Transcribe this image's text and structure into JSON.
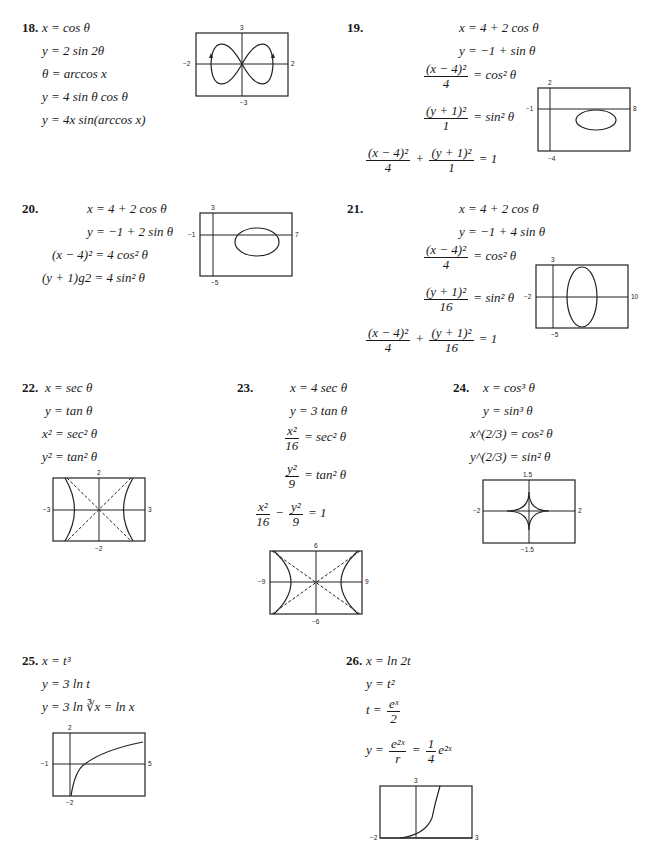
{
  "problems": [
    {
      "number": "18.",
      "lines": [
        "x = cos θ",
        "y = 2 sin 2θ",
        "θ = arccos x",
        "y = 4 sin θ cos θ",
        "y = 4x sin(arccos x)"
      ],
      "graph": {
        "ymax": "3",
        "ymin": "−3",
        "xmin": "−2",
        "xmax": "2"
      }
    },
    {
      "number": "19.",
      "lines": [
        "x = 4 + 2 cos θ",
        "y = −1 + sin θ"
      ],
      "frac1": {
        "num": "(x − 4)²",
        "den": "4",
        "rhs": "= cos² θ"
      },
      "frac2": {
        "num": "(y + 1)²",
        "den": "1",
        "rhs": "= sin² θ"
      },
      "final": {
        "a_num": "(x − 4)²",
        "a_den": "4",
        "op": "+",
        "b_num": "(y + 1)²",
        "b_den": "1",
        "rhs": "= 1"
      },
      "graph": {
        "ymax": "2",
        "ymin": "−4",
        "xmin": "−1",
        "xmax": "8"
      }
    },
    {
      "number": "20.",
      "lines": [
        "x = 4 + 2 cos θ",
        "y = −1 + 2 sin θ",
        "(x − 4)² = 4 cos² θ",
        "(y + 1)g2 = 4 sin² θ"
      ],
      "graph": {
        "ymax": "3",
        "ymin": "−5",
        "xmin": "−1",
        "xmax": "7"
      }
    },
    {
      "number": "21.",
      "lines": [
        "x = 4 + 2 cos θ",
        "y = −1 + 4 sin θ"
      ],
      "frac1": {
        "num": "(x − 4)²",
        "den": "4",
        "rhs": "= cos² θ"
      },
      "frac2": {
        "num": "(y + 1)²",
        "den": "16",
        "rhs": "= sin² θ"
      },
      "final": {
        "a_num": "(x − 4)²",
        "a_den": "4",
        "op": "+",
        "b_num": "(y + 1)²",
        "b_den": "16",
        "rhs": "= 1"
      },
      "graph": {
        "ymax": "3",
        "ymin": "−5",
        "xmin": "−2",
        "xmax": "10"
      }
    },
    {
      "number": "22.",
      "lines": [
        "x = sec θ",
        "y = tan θ",
        "x² = sec² θ",
        "y² = tan² θ"
      ],
      "graph": {
        "ymax": "2",
        "ymin": "−2",
        "xmin": "−3",
        "xmax": "3"
      }
    },
    {
      "number": "23.",
      "lines": [
        "x = 4 sec θ",
        "y = 3 tan θ"
      ],
      "frac1": {
        "num": "x²",
        "den": "16",
        "rhs": "= sec² θ"
      },
      "frac2": {
        "num": "y²",
        "den": "9",
        "rhs": "= tan² θ"
      },
      "final": {
        "a_num": "x²",
        "a_den": "16",
        "op": "−",
        "b_num": "y²",
        "b_den": "9",
        "rhs": "= 1"
      },
      "graph": {
        "ymax": "6",
        "ymin": "−6",
        "xmin": "−9",
        "xmax": "9"
      }
    },
    {
      "number": "24.",
      "lines": [
        "x = cos³ θ",
        "y = sin³ θ",
        "x^(2/3) = cos² θ",
        "y^(2/3) = sin² θ"
      ],
      "graph": {
        "ymax": "1.5",
        "ymin": "−1.5",
        "xmin": "−2",
        "xmax": "2"
      }
    },
    {
      "number": "25.",
      "lines": [
        "x = t³",
        "y = 3 ln t",
        "y = 3 ln ∛x = ln x"
      ],
      "graph": {
        "ymax": "2",
        "ymin": "−2",
        "xmin": "−1",
        "xmax": "5"
      }
    },
    {
      "number": "26.",
      "lines": [
        "x = ln 2t",
        "y = t²"
      ],
      "frac1": {
        "lhs": "t =",
        "num": "eˣ",
        "den": "2"
      },
      "frac2": {
        "lhs": "y =",
        "num": "e²ˣ",
        "den": "r",
        "mid": "=",
        "num2": "1",
        "den2": "4",
        "tail": "e²ˣ"
      },
      "graph": {
        "ymax": "3",
        "ymin": "",
        "xmin": "−2",
        "xmax": "3"
      }
    }
  ]
}
